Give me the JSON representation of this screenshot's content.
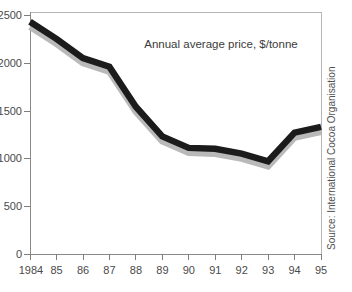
{
  "chart_data": {
    "type": "line",
    "title": "",
    "annotation": "Annual average price, $/tonne",
    "source": "Source: International Cocoa Organisation",
    "xlabel": "",
    "ylabel": "",
    "grid": false,
    "legend": "none",
    "categories": [
      "1984",
      "85",
      "86",
      "87",
      "88",
      "89",
      "90",
      "91",
      "92",
      "93",
      "94",
      "95"
    ],
    "x_tick_labels": [
      "1984",
      "85",
      "86",
      "87",
      "88",
      "89",
      "90",
      "91",
      "92",
      "93",
      "94",
      "95"
    ],
    "y_tick_labels": [
      "2500",
      "2000",
      "1500",
      "1000",
      "500",
      "0"
    ],
    "y_tick_labels_clipped": [
      "500",
      "000",
      "500",
      "000",
      "500",
      "0"
    ],
    "y_tick_values": [
      2500,
      2000,
      1500,
      1000,
      500,
      0
    ],
    "ylim": [
      0,
      2500
    ],
    "series": [
      {
        "name": "Annual average price, $/tonne",
        "color": "#1b1b1b",
        "shadow_color": "#b9b9b9",
        "values": [
          2430,
          2250,
          2050,
          1960,
          1540,
          1230,
          1110,
          1100,
          1050,
          970,
          1270,
          1330
        ]
      }
    ]
  },
  "axes": {
    "frame_color": "#b5b5b5",
    "axis_color": "#8a8a8a",
    "tick_color": "#7d7d7d",
    "label_color": "#4a4a4a"
  },
  "page": {
    "background": "#ffffff"
  }
}
